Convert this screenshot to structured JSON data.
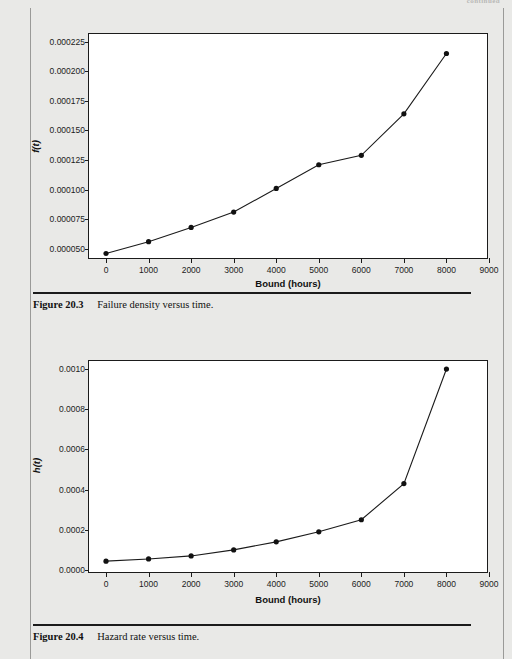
{
  "page": {
    "continued_note": "continued",
    "background_color": "#e9e9e7"
  },
  "figures": [
    {
      "id": "figure-20-3",
      "caption_number": "Figure 20.3",
      "caption_title": "Failure density versus time."
    },
    {
      "id": "figure-20-4",
      "caption_number": "Figure 20.4",
      "caption_title": "Hazard rate versus time."
    }
  ],
  "chart_data": [
    {
      "type": "line",
      "id": "failure-density-chart",
      "title": "",
      "xlabel": "Bound (hours)",
      "ylabel": "f(t)",
      "x": [
        0,
        1000,
        2000,
        3000,
        4000,
        5000,
        6000,
        7000,
        8000
      ],
      "values": [
        4.6e-05,
        5.6e-05,
        6.8e-05,
        8.1e-05,
        0.000101,
        0.000121,
        0.000129,
        0.000164,
        0.000215
      ],
      "xticklabels": [
        "0",
        "1000",
        "2000",
        "3000",
        "4000",
        "5000",
        "6000",
        "7000",
        "8000",
        "9000"
      ],
      "xticks": [
        0,
        1000,
        2000,
        3000,
        4000,
        5000,
        6000,
        7000,
        8000,
        9000
      ],
      "yticklabels": [
        "0.000050",
        "0.000075",
        "0.000100",
        "0.000125",
        "0.000150",
        "0.000175",
        "0.000200",
        "0.000225"
      ],
      "yticks": [
        5e-05,
        7.5e-05,
        0.0001,
        0.000125,
        0.00015,
        0.000175,
        0.0002,
        0.000225
      ],
      "xlim": [
        -400,
        9000
      ],
      "ylim": [
        4.05e-05,
        0.0002315
      ],
      "grid": false,
      "legend": "none",
      "marker": "filled-circle",
      "line_color": "#1b1b1b",
      "marker_color": "#111111"
    },
    {
      "type": "line",
      "id": "hazard-rate-chart",
      "title": "",
      "xlabel": "Bound (hours)",
      "ylabel": "h(t)",
      "x": [
        0,
        1000,
        2000,
        3000,
        4000,
        5000,
        6000,
        7000,
        8000
      ],
      "values": [
        4.4e-05,
        5.5e-05,
        7e-05,
        0.0001,
        0.00014,
        0.00019,
        0.00025,
        0.00043,
        0.001
      ],
      "xticklabels": [
        "0",
        "1000",
        "2000",
        "3000",
        "4000",
        "5000",
        "6000",
        "7000",
        "8000",
        "9000"
      ],
      "xticks": [
        0,
        1000,
        2000,
        3000,
        4000,
        5000,
        6000,
        7000,
        8000,
        9000
      ],
      "yticklabels": [
        "0.0000",
        "0.0002",
        "0.0004",
        "0.0006",
        "0.0008",
        "0.0010"
      ],
      "yticks": [
        0,
        0.0002,
        0.0004,
        0.0006,
        0.0008,
        0.001
      ],
      "xlim": [
        -400,
        9000
      ],
      "ylim": [
        -2e-05,
        0.00104
      ],
      "grid": false,
      "legend": "none",
      "marker": "filled-circle",
      "line_color": "#1b1b1b",
      "marker_color": "#111111"
    }
  ]
}
